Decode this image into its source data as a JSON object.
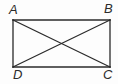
{
  "figure": {
    "kind": "rectangle-with-diagonals",
    "background_color": "#fdfdfd",
    "stroke_color": "#2a2a2a",
    "label_color": "#2b2b2b",
    "stroke_width": 1.3,
    "vertices": [
      {
        "name": "A",
        "label": "A",
        "x": 13,
        "y": 20,
        "label_x": 9,
        "label_y": 3
      },
      {
        "name": "B",
        "label": "B",
        "x": 110,
        "y": 20,
        "label_x": 104,
        "label_y": 2
      },
      {
        "name": "C",
        "label": "C",
        "x": 110,
        "y": 67,
        "label_x": 103,
        "label_y": 68
      },
      {
        "name": "D",
        "label": "D",
        "x": 13,
        "y": 67,
        "label_x": 13,
        "label_y": 68
      }
    ],
    "sides": [
      {
        "name": "side-AB",
        "from": "A",
        "to": "B",
        "x1": 13,
        "y1": 20,
        "x2": 110,
        "y2": 20
      },
      {
        "name": "side-BC",
        "from": "B",
        "to": "C",
        "x1": 110,
        "y1": 20,
        "x2": 110,
        "y2": 67
      },
      {
        "name": "side-CD",
        "from": "C",
        "to": "D",
        "x1": 110,
        "y1": 67,
        "x2": 13,
        "y2": 67
      },
      {
        "name": "side-DA",
        "from": "D",
        "to": "A",
        "x1": 13,
        "y1": 67,
        "x2": 13,
        "y2": 20
      }
    ],
    "diagonals": [
      {
        "name": "diagonal-AC",
        "from": "A",
        "to": "C",
        "x1": 13,
        "y1": 20,
        "x2": 110,
        "y2": 67
      },
      {
        "name": "diagonal-BD",
        "from": "B",
        "to": "D",
        "x1": 110,
        "y1": 20,
        "x2": 13,
        "y2": 67
      }
    ],
    "intersection": {
      "name": "diagonal-intersection",
      "x": 61.5,
      "y": 43.5
    }
  }
}
